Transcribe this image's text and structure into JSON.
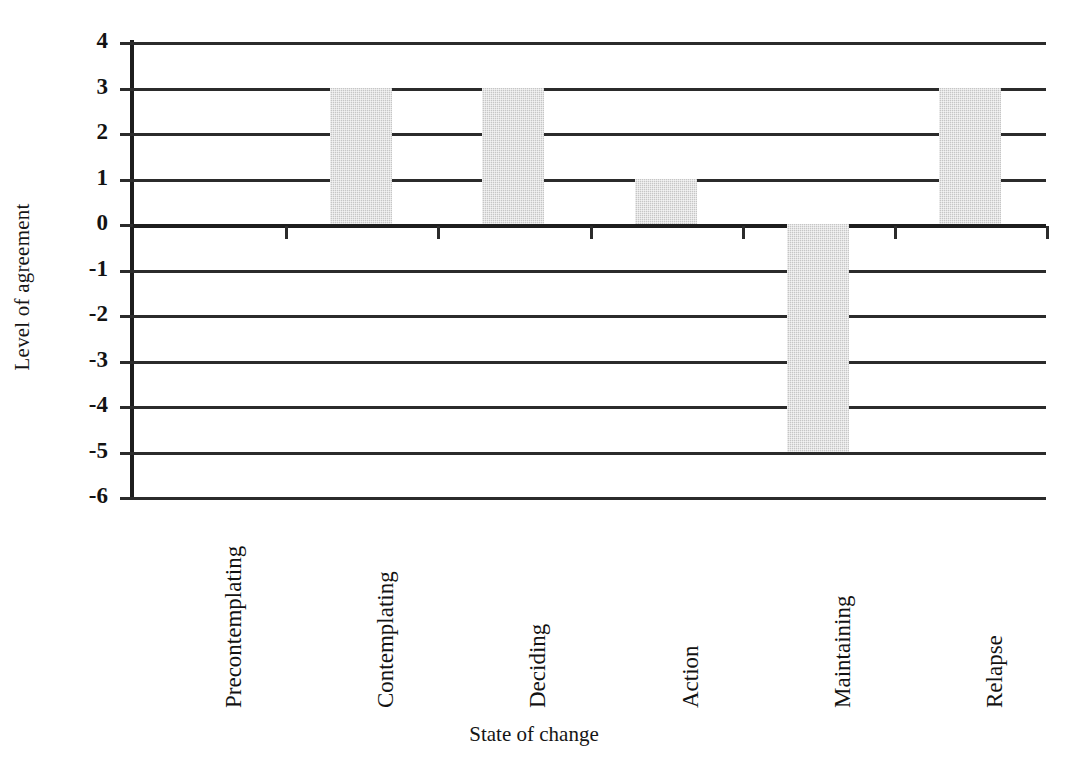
{
  "chart_data": {
    "type": "bar",
    "title": "",
    "xlabel": "State of change",
    "ylabel": "Level of agreement",
    "categories": [
      "Precontemplating",
      "Contemplating",
      "Deciding",
      "Action",
      "Maintaining",
      "Relapse"
    ],
    "values": [
      0,
      3,
      3,
      1,
      -5,
      3
    ],
    "ylim": [
      -6,
      4
    ],
    "yticks": [
      4,
      3,
      2,
      1,
      0,
      -1,
      -2,
      -3,
      -4,
      -5,
      -6
    ],
    "ytick_labels": [
      "4",
      "3",
      "2",
      "1",
      "0",
      "-1",
      "-2",
      "-3",
      "-4",
      "-5",
      "-6"
    ],
    "grid": true,
    "legend": "none",
    "bar_color": "#c6c6c6",
    "axis_color": "#2b2b2b",
    "orientation": "vertical",
    "tick_label_rotation": 90
  }
}
